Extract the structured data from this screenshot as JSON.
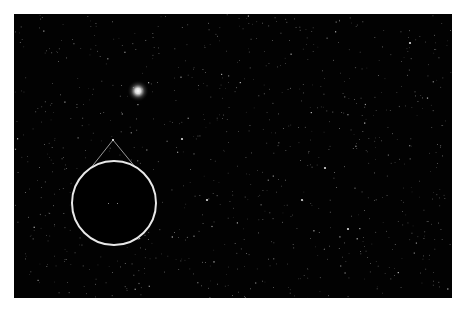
{
  "image": {
    "subject": "Star field with magnified inset",
    "background_color": "#020202",
    "frame_color": "#ffffff",
    "bright_star": {
      "x": 124,
      "y": 77,
      "color": "#ffffff"
    },
    "inset": {
      "center_x": 100,
      "center_y": 189,
      "radius": 42,
      "stroke_color": "#e8e8e8",
      "pointer_apex": {
        "x": 99,
        "y": 126
      },
      "faint_objects": [
        {
          "x": 94,
          "y": 189
        },
        {
          "x": 103,
          "y": 189
        }
      ]
    },
    "notable_stars": [
      {
        "x": 168,
        "y": 125
      },
      {
        "x": 311,
        "y": 154
      },
      {
        "x": 334,
        "y": 215
      },
      {
        "x": 193,
        "y": 186
      },
      {
        "x": 396,
        "y": 29
      },
      {
        "x": 288,
        "y": 186
      }
    ]
  }
}
